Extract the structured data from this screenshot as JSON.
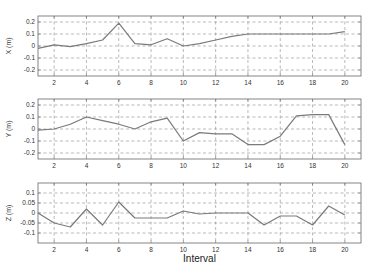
{
  "chart_data": [
    {
      "type": "line",
      "title": "",
      "xlabel": "",
      "ylabel": "X (m)",
      "xlim": [
        1,
        21
      ],
      "ylim": [
        -0.25,
        0.25
      ],
      "xticks": [
        2,
        4,
        6,
        8,
        10,
        12,
        14,
        16,
        18,
        20
      ],
      "yticks": [
        -0.2,
        -0.1,
        0,
        0.1,
        0.2
      ],
      "ytick_labels": [
        "-0.2",
        "-0.1",
        "0",
        "0.1",
        "0.2"
      ],
      "grid": true,
      "x": [
        1,
        2,
        3,
        4,
        5,
        6,
        7,
        8,
        9,
        10,
        11,
        12,
        13,
        14,
        15,
        16,
        17,
        18,
        19,
        20
      ],
      "values": [
        -0.02,
        0.01,
        -0.005,
        0.02,
        0.05,
        0.19,
        0.02,
        0.01,
        0.06,
        0.0,
        0.02,
        0.05,
        0.08,
        0.1,
        0.1,
        0.1,
        0.1,
        0.1,
        0.1,
        0.12
      ]
    },
    {
      "type": "line",
      "title": "",
      "xlabel": "",
      "ylabel": "Y (m)",
      "xlim": [
        1,
        21
      ],
      "ylim": [
        -0.25,
        0.25
      ],
      "xticks": [
        2,
        4,
        6,
        8,
        10,
        12,
        14,
        16,
        18,
        20
      ],
      "yticks": [
        -0.2,
        -0.1,
        0,
        0.1,
        0.2
      ],
      "ytick_labels": [
        "-0.2",
        "-0.1",
        "0",
        "0.1",
        "0.2"
      ],
      "grid": true,
      "x": [
        1,
        2,
        3,
        4,
        5,
        6,
        7,
        8,
        9,
        10,
        11,
        12,
        13,
        14,
        15,
        16,
        17,
        18,
        19,
        20
      ],
      "values": [
        -0.01,
        0.0,
        0.04,
        0.1,
        0.07,
        0.04,
        0.0,
        0.06,
        0.09,
        -0.1,
        -0.03,
        -0.04,
        -0.04,
        -0.13,
        -0.13,
        -0.06,
        0.11,
        0.12,
        0.12,
        -0.13
      ]
    },
    {
      "type": "line",
      "title": "",
      "xlabel": "Interval",
      "ylabel": "Z (m)",
      "xlim": [
        1,
        21
      ],
      "ylim": [
        -0.15,
        0.15
      ],
      "xticks": [
        2,
        4,
        6,
        8,
        10,
        12,
        14,
        16,
        18,
        20
      ],
      "yticks": [
        -0.1,
        -0.05,
        0,
        0.05,
        0.1
      ],
      "ytick_labels": [
        "-0.1",
        "-0.05",
        "0",
        "0.05",
        "0.1"
      ],
      "grid": true,
      "x": [
        1,
        2,
        3,
        4,
        5,
        6,
        7,
        8,
        9,
        10,
        11,
        12,
        13,
        14,
        15,
        16,
        17,
        18,
        19,
        20
      ],
      "values": [
        0.0,
        -0.05,
        -0.07,
        0.02,
        -0.06,
        0.055,
        -0.025,
        -0.025,
        -0.025,
        0.01,
        -0.005,
        0.0,
        0.0,
        0.0,
        -0.06,
        -0.015,
        -0.015,
        -0.06,
        0.035,
        -0.01
      ]
    }
  ],
  "style": {
    "line_color": "#7a7a7a",
    "grid_color": "#8a8a8a",
    "frame_color": "#666666"
  }
}
